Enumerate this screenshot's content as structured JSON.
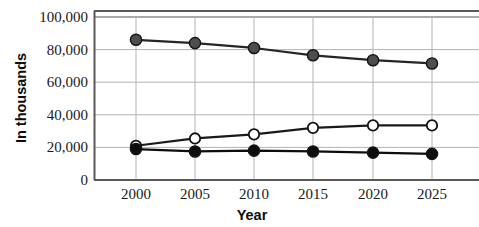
{
  "chart_data": {
    "type": "line",
    "title": "",
    "xlabel": "Year",
    "ylabel": "In thousands",
    "categories": [
      "2000",
      "2005",
      "2010",
      "2015",
      "2020",
      "2025"
    ],
    "x": [
      2000,
      2005,
      2010,
      2015,
      2020,
      2025
    ],
    "xlim": [
      1997.5,
      2028.5
    ],
    "ylim": [
      0,
      105000
    ],
    "yticks": [
      0,
      20000,
      40000,
      60000,
      80000,
      100000
    ],
    "ytick_labels": [
      "0",
      "20,000",
      "40,000",
      "60,000",
      "80,000",
      "100,000"
    ],
    "grid": true,
    "legend_position": "none",
    "series": [
      {
        "name": "gray-series",
        "marker": "filled-circle",
        "marker_color": "#4d4d4d",
        "line_color": "#262626",
        "values": [
          86000,
          84000,
          81000,
          76500,
          73500,
          71500
        ]
      },
      {
        "name": "open-series",
        "marker": "open-circle",
        "marker_color": "#ffffff",
        "line_color": "#1a1a1a",
        "values": [
          21000,
          25500,
          28000,
          32000,
          33500,
          33500
        ]
      },
      {
        "name": "black-series",
        "marker": "filled-circle",
        "marker_color": "#0d0d0d",
        "line_color": "#0d0d0d",
        "values": [
          19000,
          17500,
          18000,
          17500,
          16800,
          16000
        ]
      }
    ]
  },
  "axis": {
    "y_title": "In thousands",
    "x_title": "Year",
    "y_labels": [
      "100,000",
      "80,000",
      "60,000",
      "40,000",
      "20,000",
      "0"
    ],
    "x_labels": [
      "2000",
      "2005",
      "2010",
      "2015",
      "2020",
      "2025"
    ]
  },
  "colors": {
    "gridline": "#b3b3b3",
    "frame": "#595959",
    "text": "#1a1a1a",
    "gray_marker": "#4d4d4d",
    "black_marker": "#0d0d0d",
    "open_marker": "#ffffff",
    "background": "#ffffff"
  }
}
